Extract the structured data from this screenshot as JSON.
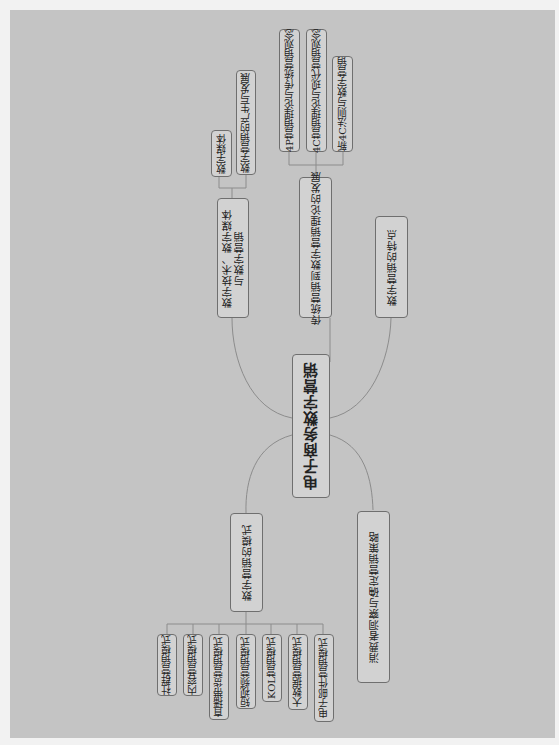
{
  "mindmap": {
    "root": {
      "label": "电子商务数字营销"
    },
    "branches": [
      {
        "label": "数字技术、数字媒体与数字营销",
        "label_line1": "数字技术、数字媒体",
        "label_line2": "与数字营销",
        "children": [
          "数字媒体",
          "数字营销的产生与发展"
        ]
      },
      {
        "label": "传统营销到数字营销理论的发展",
        "children": [
          "4P营销理论与传统营销观念",
          "4C营销理论与现代营销观念",
          "新4C法则与数字营销"
        ]
      },
      {
        "label": "数字营销的特点",
        "children": []
      },
      {
        "label": "数字营销的模式",
        "children": [
          "社群营销模式",
          "内容营销模式",
          "直播带货营销模式",
          "短视频营销模式",
          "KOL营销模式",
          "大数据营销模式",
          "电子邮件营销模式"
        ]
      },
      {
        "label": "消费者洞察与确定营销策略",
        "children": []
      }
    ]
  },
  "colors": {
    "background": "#c4c4c4",
    "node_fill": "#d2d2d2",
    "node_border": "#6f6f6f",
    "line": "#8a8a8a"
  }
}
